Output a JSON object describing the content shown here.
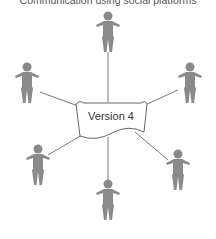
{
  "title": "Communication using social platforms",
  "center": {
    "label": "Version 4",
    "icon": "document-icon"
  },
  "figures": [
    {
      "id": "top",
      "icon": "person-icon",
      "x": 108,
      "y": 16
    },
    {
      "id": "left",
      "icon": "person-icon",
      "x": 27,
      "y": 67
    },
    {
      "id": "right",
      "icon": "person-icon",
      "x": 190,
      "y": 67
    },
    {
      "id": "bottom-left",
      "icon": "person-icon",
      "x": 38,
      "y": 149
    },
    {
      "id": "bottom-center",
      "icon": "person-icon",
      "x": 108,
      "y": 184
    },
    {
      "id": "bottom-right",
      "icon": "person-icon",
      "x": 178,
      "y": 154
    }
  ],
  "colors": {
    "figure": "#8a8a8a",
    "line": "#555555",
    "doc_border": "#555555"
  }
}
